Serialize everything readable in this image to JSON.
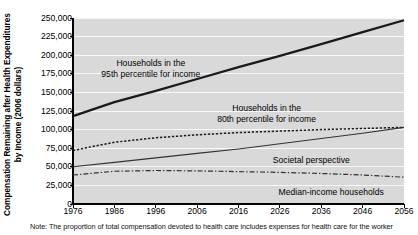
{
  "chart_data": {
    "type": "line",
    "title": "",
    "xlabel": "",
    "ylabel": "Compensation Remaining after Health Expenditures by Income (2006 dollars)",
    "xlim": [
      1976,
      2056
    ],
    "ylim": [
      0,
      250000
    ],
    "xticks": [
      "1976",
      "1986",
      "1996",
      "2006",
      "2016",
      "2026",
      "2036",
      "2046",
      "2056"
    ],
    "yticks": [
      "250,000",
      "225,000",
      "200,000",
      "175,000",
      "150,000",
      "125,000",
      "100,000",
      "75,000",
      "50,000",
      "25,000",
      "0"
    ],
    "grid": true,
    "plot_background": "#d9d9d9",
    "legend_position": "inline-annotations",
    "x": [
      1976,
      1986,
      1996,
      2006,
      2016,
      2026,
      2036,
      2046,
      2056
    ],
    "series": [
      {
        "name": "Households in the 95th percentile for income",
        "style": "thick-solid",
        "color": "#1a1a1a",
        "values": [
          118000,
          137000,
          152000,
          168000,
          184000,
          199000,
          215000,
          231000,
          247000
        ]
      },
      {
        "name": "Households in the 80th percentile for income",
        "style": "dotted",
        "color": "#1a1a1a",
        "values": [
          72000,
          83000,
          89000,
          93000,
          96000,
          98000,
          100000,
          101500,
          103000
        ]
      },
      {
        "name": "Societal perspective",
        "style": "thin-solid",
        "color": "#333333",
        "values": [
          50000,
          56000,
          62000,
          68000,
          74000,
          81000,
          88000,
          95000,
          103000
        ]
      },
      {
        "name": "Median-income households",
        "style": "dash-dot",
        "color": "#333333",
        "values": [
          39000,
          44000,
          45000,
          44500,
          43500,
          42500,
          41000,
          39000,
          36000
        ]
      }
    ],
    "annotations": [
      {
        "id": "label-95th",
        "lines": [
          "Households in the",
          "95th percentile for income"
        ],
        "x_pct": 23.5,
        "y_px": 58
      },
      {
        "id": "label-80th",
        "lines": [
          "Households in the",
          "80th percentile for income"
        ],
        "x_pct": 58.5,
        "y_px": 103
      },
      {
        "id": "label-societal",
        "lines": [
          "Societal perspective"
        ],
        "x_pct": 72.0,
        "y_px": 155
      },
      {
        "id": "label-median",
        "lines": [
          "Median-income households"
        ],
        "x_pct": 78.0,
        "y_px": 187
      }
    ]
  },
  "note": {
    "text": "Note: The proportion of total compensation devoted to health care includes expenses for health care for the worker"
  }
}
